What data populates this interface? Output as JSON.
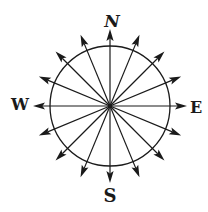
{
  "diagram": {
    "center": {
      "x": 110,
      "y": 106
    },
    "circle_radius": 60,
    "arrow_tip_radius": 77,
    "arrowhead_length": 12,
    "arrowhead_half_width": 3.6,
    "stroke_color": "#1a1a1a",
    "background_color": "#ffffff",
    "directions": [
      {
        "name": "N",
        "angle": 0
      },
      {
        "name": "NNE",
        "angle": 22.5
      },
      {
        "name": "NE",
        "angle": 45
      },
      {
        "name": "ENE",
        "angle": 67.5
      },
      {
        "name": "E",
        "angle": 90
      },
      {
        "name": "ESE",
        "angle": 112.5
      },
      {
        "name": "SE",
        "angle": 135
      },
      {
        "name": "SSE",
        "angle": 157.5
      },
      {
        "name": "S",
        "angle": 180
      },
      {
        "name": "SSW",
        "angle": 202.5
      },
      {
        "name": "SW",
        "angle": 225
      },
      {
        "name": "WSW",
        "angle": 247.5
      },
      {
        "name": "W",
        "angle": 270
      },
      {
        "name": "WNW",
        "angle": 292.5
      },
      {
        "name": "NW",
        "angle": 315
      },
      {
        "name": "NNW",
        "angle": 337.5
      }
    ],
    "labels": {
      "north": "N",
      "east": "E",
      "south": "S",
      "west": "W"
    }
  }
}
